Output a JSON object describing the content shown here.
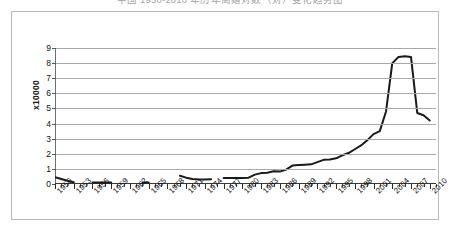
{
  "chart_title": "中国 1950-2010 年历年离婚对数（对）变化趋势图",
  "yaxis_caption": "x10000",
  "chart_data": {
    "type": "line",
    "title": "中国 1950-2010 年历年离婚对数（对）变化趋势图",
    "xlabel": "",
    "ylabel": "x10000",
    "ylim": [
      0,
      9
    ],
    "yticks": [
      0,
      1,
      2,
      3,
      4,
      5,
      6,
      7,
      8,
      9
    ],
    "xlim": [
      1950,
      2011
    ],
    "xtick_labels": [
      "1950",
      "1953",
      "1956",
      "1959",
      "1962",
      "1965",
      "1968",
      "1971",
      "1974",
      "1977",
      "1980",
      "1983",
      "1986",
      "1989",
      "1992",
      "1995",
      "1998",
      "2001",
      "2004",
      "2007",
      "2010"
    ],
    "xtick_step_years": 3,
    "minor_tick_step_years": 1,
    "grid": "horizontal",
    "legend": "none",
    "line_color": "#1a1a1a",
    "grid_color": "#a8a8a8",
    "series": [
      {
        "name": "离婚对数",
        "x": [
          1950,
          1951,
          1952,
          1953,
          1954,
          1955,
          1956,
          1957,
          1958,
          1959,
          1960,
          1961,
          1962,
          1963,
          1964,
          1965,
          1966,
          1967,
          1968,
          1969,
          1970,
          1971,
          1972,
          1973,
          1974,
          1975,
          1976,
          1977,
          1978,
          1979,
          1980,
          1981,
          1982,
          1983,
          1984,
          1985,
          1986,
          1987,
          1988,
          1989,
          1990,
          1991,
          1992,
          1993,
          1994,
          1995,
          1996,
          1997,
          1998,
          1999,
          2000,
          2001,
          2002,
          2003,
          2004,
          2005,
          2006,
          2007,
          2008,
          2009,
          2010
        ],
        "values": [
          0.45,
          0.33,
          0.22,
          0.12,
          null,
          null,
          0.1,
          0.1,
          0.1,
          0.1,
          null,
          null,
          null,
          null,
          0.1,
          0.1,
          null,
          null,
          null,
          null,
          0.55,
          0.42,
          0.33,
          0.3,
          0.3,
          0.32,
          null,
          0.4,
          0.4,
          0.4,
          0.4,
          0.42,
          0.62,
          0.72,
          0.75,
          0.85,
          0.82,
          0.95,
          1.22,
          1.25,
          1.28,
          1.3,
          1.45,
          1.6,
          1.62,
          1.7,
          1.9,
          2.05,
          2.3,
          2.55,
          2.9,
          3.3,
          3.5,
          4.8,
          8.0,
          8.4,
          8.45,
          8.4,
          4.7,
          4.55,
          4.2
        ]
      }
    ],
    "peak": {
      "year": 2006,
      "value": 8.45
    }
  },
  "ytick_labels": [
    "9",
    "8",
    "7",
    "6",
    "5",
    "4",
    "3",
    "2",
    "1",
    "0"
  ]
}
